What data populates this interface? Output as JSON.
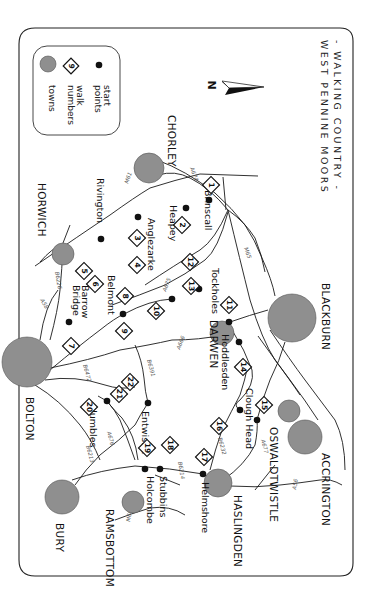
{
  "title": {
    "line1": "- WALKING COUNTRY -",
    "line2": "WEST PENNINE MOORS"
  },
  "legend": {
    "start_points": "start points",
    "start_points_l1": "start",
    "start_points_l2": "points",
    "walk_numbers_l1": "walk",
    "walk_numbers_l2": "numbers",
    "walk_sample": "9",
    "towns": "towns"
  },
  "compass": {
    "label": "N"
  },
  "colors": {
    "town_fill": "#8f8f8f",
    "ink": "#111111",
    "background": "#ffffff"
  },
  "towns": [
    {
      "name": "CHORLEY",
      "x": 149,
      "y": 168,
      "r": 15
    },
    {
      "name": "HORWICH",
      "x": 63,
      "y": 254,
      "r": 11
    },
    {
      "name": "BOLTON",
      "x": 27,
      "y": 362,
      "r": 25
    },
    {
      "name": "DARWEN",
      "x": 222,
      "y": 333,
      "r": 12
    },
    {
      "name": "BLACKBURN",
      "x": 292,
      "y": 318,
      "r": 24
    },
    {
      "name": "OSWALDTWISTLE",
      "x": 289,
      "y": 411,
      "r": 11
    },
    {
      "name": "ACCRINGTON",
      "x": 305,
      "y": 437,
      "r": 17
    },
    {
      "name": "HASLINGDEN",
      "x": 218,
      "y": 483,
      "r": 14
    },
    {
      "name": "RAMSBOTTOM",
      "x": 133,
      "y": 502,
      "r": 11
    },
    {
      "name": "BURY",
      "x": 62,
      "y": 497,
      "r": 17
    }
  ],
  "start_points": [
    {
      "name": "Brinscall",
      "x": 209,
      "y": 200
    },
    {
      "name": "Heapey",
      "x": 186,
      "y": 208
    },
    {
      "name": "Anglezarke",
      "x": 138,
      "y": 217
    },
    {
      "name": "Rivington",
      "x": 101,
      "y": 239
    },
    {
      "name": "Barrow Bridge",
      "x": 69,
      "y": 322
    },
    {
      "name": "Belmont",
      "x": 123,
      "y": 314
    },
    {
      "name": "Tockholes",
      "x": 199,
      "y": 289
    },
    {
      "name": "",
      "x": 172,
      "y": 299
    },
    {
      "name": "",
      "x": 229,
      "y": 322
    },
    {
      "name": "Hoddlesden",
      "x": 239,
      "y": 342
    },
    {
      "name": "Clough Head",
      "x": 240,
      "y": 410
    },
    {
      "name": "",
      "x": 257,
      "y": 420
    },
    {
      "name": "Entwistle",
      "x": 148,
      "y": 403
    },
    {
      "name": "Jumbles",
      "x": 107,
      "y": 401
    },
    {
      "name": "Holcombe",
      "x": 145,
      "y": 469
    },
    {
      "name": "Stubbins",
      "x": 160,
      "y": 469
    },
    {
      "name": "Helmshore",
      "x": 203,
      "y": 474
    }
  ],
  "walks": [
    {
      "n": "1",
      "x": 211,
      "y": 185
    },
    {
      "n": "2",
      "x": 182,
      "y": 225
    },
    {
      "n": "3",
      "x": 137,
      "y": 238
    },
    {
      "n": "4",
      "x": 137,
      "y": 265
    },
    {
      "n": "5",
      "x": 84,
      "y": 271
    },
    {
      "n": "6",
      "x": 95,
      "y": 284
    },
    {
      "n": "7",
      "x": 71,
      "y": 346
    },
    {
      "n": "8",
      "x": 125,
      "y": 296
    },
    {
      "n": "9",
      "x": 124,
      "y": 331
    },
    {
      "n": "10",
      "x": 156,
      "y": 311
    },
    {
      "n": "11",
      "x": 229,
      "y": 305
    },
    {
      "n": "12",
      "x": 190,
      "y": 262
    },
    {
      "n": "13",
      "x": 191,
      "y": 286
    },
    {
      "n": "14",
      "x": 243,
      "y": 367
    },
    {
      "n": "15",
      "x": 264,
      "y": 405
    },
    {
      "n": "16",
      "x": 219,
      "y": 426
    },
    {
      "n": "17",
      "x": 204,
      "y": 457
    },
    {
      "n": "18",
      "x": 170,
      "y": 445
    },
    {
      "n": "19",
      "x": 147,
      "y": 448
    },
    {
      "n": "20",
      "x": 89,
      "y": 407
    },
    {
      "n": "21",
      "x": 119,
      "y": 394
    },
    {
      "n": "22",
      "x": 130,
      "y": 382
    }
  ],
  "roads": [
    {
      "name": "A674",
      "label_x": 193,
      "label_y": 172
    },
    {
      "name": "M61",
      "label_x": 132,
      "label_y": 183
    },
    {
      "name": "M65",
      "label_x": 247,
      "label_y": 254
    },
    {
      "name": "A675",
      "label_x": 169,
      "label_y": 287
    },
    {
      "name": "B6226",
      "label_x": 60,
      "label_y": 280
    },
    {
      "name": "A58",
      "label_x": 45,
      "label_y": 305
    },
    {
      "name": "A666",
      "label_x": 185,
      "label_y": 343
    },
    {
      "name": "B6391",
      "label_x": 152,
      "label_y": 365
    },
    {
      "name": "B6472",
      "label_x": 88,
      "label_y": 370
    },
    {
      "name": "A676",
      "label_x": 109,
      "label_y": 437
    },
    {
      "name": "B6213",
      "label_x": 89,
      "label_y": 454
    },
    {
      "name": "B6214",
      "label_x": 182,
      "label_y": 465
    },
    {
      "name": "M66",
      "label_x": 127,
      "label_y": 518
    },
    {
      "name": "B6232",
      "label_x": 221,
      "label_y": 445
    },
    {
      "name": "A677",
      "label_x": 264,
      "label_y": 447
    },
    {
      "name": "A56",
      "label_x": 298,
      "label_y": 484
    }
  ]
}
